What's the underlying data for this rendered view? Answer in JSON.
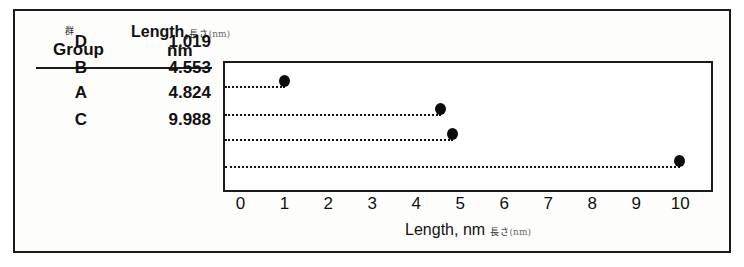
{
  "table": {
    "group_header_jp": "群",
    "group_header": "Group",
    "value_header_en": "Length,",
    "value_header_jp": "長さ",
    "value_header_paren": "(nm)",
    "value_header_unit": "nm",
    "rows": [
      {
        "group": "D",
        "value": "1.019"
      },
      {
        "group": "B",
        "value": "4.553"
      },
      {
        "group": "A",
        "value": "4.824"
      },
      {
        "group": "C",
        "value": "9.988"
      }
    ]
  },
  "axis": {
    "label_en": "Length, nm",
    "label_jp": "長さ",
    "label_paren": "(nm)",
    "ticks": [
      "0",
      "1",
      "2",
      "3",
      "4",
      "5",
      "6",
      "7",
      "8",
      "9",
      "10"
    ]
  },
  "colors": {
    "marker": "#0b0b0b",
    "frame": "#1a1a1a",
    "background": "#ffffff"
  },
  "chart_data": {
    "type": "scatter",
    "title": "",
    "xlabel": "Length, nm 長さ (nm)",
    "ylabel": "Group 群",
    "orientation": "horizontal",
    "categories": [
      "D",
      "B",
      "A",
      "C"
    ],
    "values": [
      1.019,
      4.553,
      4.824,
      9.988
    ],
    "xlim": [
      -0.35,
      10.7
    ],
    "xticks": [
      0,
      1,
      2,
      3,
      4,
      5,
      6,
      7,
      8,
      9,
      10
    ],
    "grid": false,
    "legend": false,
    "marker": "filled-circle",
    "leader_lines": "dotted-from-left-axis",
    "series": [
      {
        "name": "Length (nm)",
        "points": [
          {
            "category": "D",
            "value": 1.019
          },
          {
            "category": "B",
            "value": 4.553
          },
          {
            "category": "A",
            "value": 4.824
          },
          {
            "category": "C",
            "value": 9.988
          }
        ]
      }
    ]
  }
}
